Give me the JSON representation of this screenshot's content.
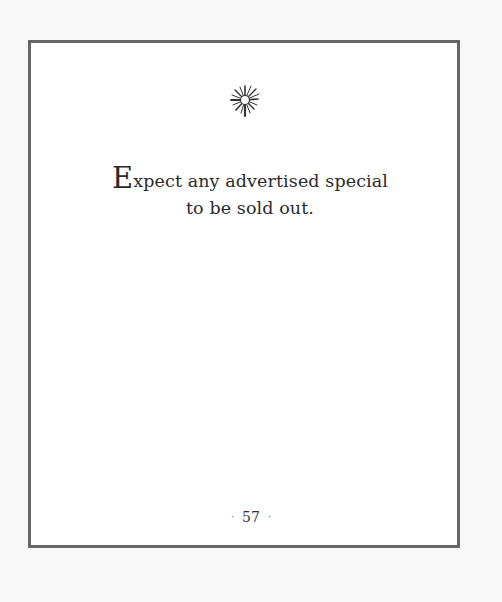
{
  "page": {
    "ornament": "starburst-icon",
    "saying": {
      "first_letter": "E",
      "line1_rest": "xpect any advertised special",
      "line2": "to be sold out."
    },
    "page_number": "57",
    "page_number_separator": "·"
  }
}
